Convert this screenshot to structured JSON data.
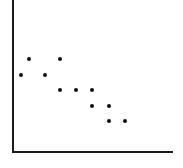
{
  "chart_data": {
    "type": "scatter",
    "title": "",
    "xlabel": "",
    "ylabel": "",
    "grid": false,
    "legend": null,
    "axis_color": "#1a1a1a",
    "point_color": "#111111",
    "points": [
      {
        "x": 21,
        "y": 75
      },
      {
        "x": 29,
        "y": 59
      },
      {
        "x": 45,
        "y": 75
      },
      {
        "x": 60,
        "y": 59
      },
      {
        "x": 60,
        "y": 90
      },
      {
        "x": 76,
        "y": 90
      },
      {
        "x": 92,
        "y": 90
      },
      {
        "x": 92,
        "y": 106
      },
      {
        "x": 109,
        "y": 106
      },
      {
        "x": 109,
        "y": 121
      },
      {
        "x": 125,
        "y": 121
      }
    ],
    "axes": {
      "origin": {
        "x": 13,
        "y": 152
      },
      "y_top": 0,
      "x_right": 173
    }
  }
}
